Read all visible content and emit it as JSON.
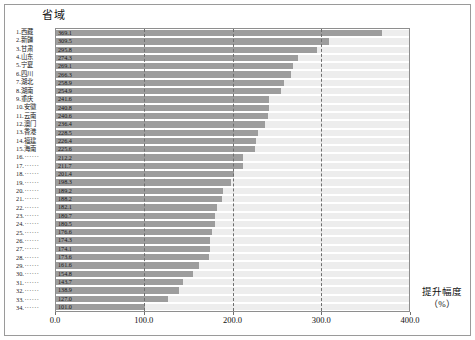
{
  "chart_data": {
    "type": "bar",
    "orientation": "horizontal",
    "title": "",
    "category_axis_title": "省域",
    "value_axis_title": "提升幅度",
    "value_axis_unit": "（%）",
    "xlabel": "提升幅度（%）",
    "ylabel": "省域",
    "xlim": [
      0,
      400
    ],
    "xticks": [
      "0.0",
      "100.0",
      "200.0",
      "300.0",
      "400.0"
    ],
    "xtick_values": [
      0,
      100,
      200,
      300,
      400
    ],
    "gridlines": [
      100,
      200,
      300
    ],
    "grid": true,
    "legend": "none",
    "bar_color": "#9d9d9d",
    "track_color": "#ededed",
    "categories": [
      "1.西藏",
      "2.新疆",
      "3.甘肃",
      "4.山东",
      "5.宁夏",
      "6.四川",
      "7.湖北",
      "8.湖南",
      "9.重庆",
      "10.安徽",
      "11.云南",
      "12.澳门",
      "13.香港",
      "14.福建",
      "15.海南",
      "16.······",
      "17.······",
      "18.······",
      "19.······",
      "20.······",
      "21.······",
      "22.······",
      "23.······",
      "24.······",
      "25.······",
      "26.······",
      "27.······",
      "28.······",
      "29.······",
      "30.······",
      "31.······",
      "32.······",
      "33.······",
      "34.······"
    ],
    "rows": [
      {
        "index": "1.",
        "name": "西藏",
        "value": 369.1,
        "label": "369.1"
      },
      {
        "index": "2.",
        "name": "新疆",
        "value": 309.5,
        "label": "309.5"
      },
      {
        "index": "3.",
        "name": "甘肃",
        "value": 295.8,
        "label": "295.8"
      },
      {
        "index": "4.",
        "name": "山东",
        "value": 274.3,
        "label": "274.3"
      },
      {
        "index": "5.",
        "name": "宁夏",
        "value": 269.1,
        "label": "269.1"
      },
      {
        "index": "6.",
        "name": "四川",
        "value": 266.3,
        "label": "266.3"
      },
      {
        "index": "7.",
        "name": "湖北",
        "value": 258.9,
        "label": "258.9"
      },
      {
        "index": "8.",
        "name": "湖南",
        "value": 254.9,
        "label": "254.9"
      },
      {
        "index": "9.",
        "name": "重庆",
        "value": 241.6,
        "label": "241.6"
      },
      {
        "index": "10.",
        "name": "安徽",
        "value": 240.8,
        "label": "240.8"
      },
      {
        "index": "11.",
        "name": "云南",
        "value": 240.6,
        "label": "240.6"
      },
      {
        "index": "12.",
        "name": "澳门",
        "value": 236.4,
        "label": "236.4"
      },
      {
        "index": "13.",
        "name": "香港",
        "value": 228.5,
        "label": "228.5"
      },
      {
        "index": "14.",
        "name": "福建",
        "value": 226.4,
        "label": "226.4"
      },
      {
        "index": "15.",
        "name": "海南",
        "value": 225.6,
        "label": "225.6"
      },
      {
        "index": "16.",
        "name": "······",
        "value": 212.2,
        "label": "212.2"
      },
      {
        "index": "17.",
        "name": "······",
        "value": 211.7,
        "label": "211.7"
      },
      {
        "index": "18.",
        "name": "······",
        "value": 201.4,
        "label": "201.4"
      },
      {
        "index": "19.",
        "name": "······",
        "value": 198.3,
        "label": "198.3"
      },
      {
        "index": "20.",
        "name": "······",
        "value": 189.2,
        "label": "189.2"
      },
      {
        "index": "21.",
        "name": "······",
        "value": 188.2,
        "label": "188.2"
      },
      {
        "index": "22.",
        "name": "······",
        "value": 182.1,
        "label": "182.1"
      },
      {
        "index": "23.",
        "name": "······",
        "value": 180.7,
        "label": "180.7"
      },
      {
        "index": "24.",
        "name": "······",
        "value": 180.5,
        "label": "180.5"
      },
      {
        "index": "25.",
        "name": "······",
        "value": 176.6,
        "label": "176.6"
      },
      {
        "index": "26.",
        "name": "······",
        "value": 174.3,
        "label": "174.3"
      },
      {
        "index": "27.",
        "name": "······",
        "value": 174.1,
        "label": "174.1"
      },
      {
        "index": "28.",
        "name": "······",
        "value": 173.6,
        "label": "173.6"
      },
      {
        "index": "29.",
        "name": "······",
        "value": 161.6,
        "label": "161.6"
      },
      {
        "index": "30.",
        "name": "······",
        "value": 154.8,
        "label": "154.8"
      },
      {
        "index": "31.",
        "name": "······",
        "value": 143.7,
        "label": "143.7"
      },
      {
        "index": "32.",
        "name": "······",
        "value": 138.9,
        "label": "138.9"
      },
      {
        "index": "33.",
        "name": "······",
        "value": 127.0,
        "label": "127.0"
      },
      {
        "index": "34.",
        "name": "······",
        "value": 101.0,
        "label": "101.0"
      }
    ],
    "values": [
      369.1,
      309.5,
      295.8,
      274.3,
      269.1,
      266.3,
      258.9,
      254.9,
      241.6,
      240.8,
      240.6,
      236.4,
      228.5,
      226.4,
      225.6,
      212.2,
      211.7,
      201.4,
      198.3,
      189.2,
      188.2,
      182.1,
      180.7,
      180.5,
      176.6,
      174.3,
      174.1,
      173.6,
      161.6,
      154.8,
      143.7,
      138.9,
      127.0,
      101.0
    ]
  }
}
